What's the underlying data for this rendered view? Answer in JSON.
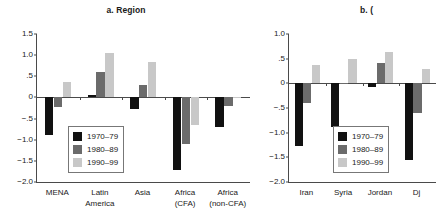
{
  "figure": {
    "background": "#ffffff",
    "series_colors": [
      "#111111",
      "#6b6b6b",
      "#c8c8c8"
    ]
  },
  "panels": [
    {
      "id": "a",
      "title": "a. Region",
      "legend": [
        "1970–79",
        "1980–89",
        "1990–99"
      ]
    },
    {
      "id": "b",
      "title": "b. (",
      "legend": [
        "1970–79",
        "1980–89",
        "1990–99"
      ]
    }
  ],
  "chart_data": [
    {
      "type": "bar",
      "title": "a. Region",
      "xlabel": "",
      "ylabel": "",
      "ylim": [
        -2.0,
        1.5
      ],
      "yticks": [
        1.5,
        1.0,
        0.5,
        0,
        -0.5,
        -1.0,
        -1.5,
        -2.0
      ],
      "ytick_labels": [
        "1.5",
        "1.0",
        ".5",
        "0",
        "−.5",
        "−1.0",
        "−1.5",
        "−2.0"
      ],
      "grid": false,
      "legend_position": "center-left-inside",
      "categories": [
        "MENA",
        "Latin America",
        "Asia",
        "Africa (CFA)",
        "Africa (non-CFA)"
      ],
      "category_lines": [
        [
          "MENA"
        ],
        [
          "Latin",
          "America"
        ],
        [
          "Asia"
        ],
        [
          "Africa",
          "(CFA)"
        ],
        [
          "Africa",
          "(non-CFA)"
        ]
      ],
      "series": [
        {
          "name": "1970–79",
          "color": "#111111",
          "values": [
            -0.88,
            0.05,
            -0.28,
            -1.72,
            -0.7
          ]
        },
        {
          "name": "1980–89",
          "color": "#6b6b6b",
          "values": [
            -0.22,
            0.59,
            0.3,
            -1.11,
            -0.2
          ]
        },
        {
          "name": "1990–99",
          "color": "#c8c8c8",
          "values": [
            0.37,
            1.04,
            0.83,
            -0.66,
            0.02
          ]
        }
      ]
    },
    {
      "type": "bar",
      "title": "b. (",
      "xlabel": "",
      "ylabel": "",
      "ylim": [
        -2.0,
        1.0
      ],
      "yticks": [
        1.0,
        0.5,
        0,
        -0.5,
        -1.0,
        -1.5,
        -2.0
      ],
      "ytick_labels": [
        "1.0",
        ".5",
        "0",
        "−.5",
        "−1.0",
        "−1.5",
        "−2.0"
      ],
      "grid": false,
      "legend_position": "center-right-inside",
      "categories": [
        "Iran",
        "Syria",
        "Jordan",
        "Dj"
      ],
      "category_lines": [
        [
          "Iran"
        ],
        [
          "Syria"
        ],
        [
          "Jordan"
        ],
        [
          "Dj"
        ]
      ],
      "series": [
        {
          "name": "1970–79",
          "color": "#111111",
          "values": [
            -1.28,
            -0.88,
            -0.07,
            -1.55
          ]
        },
        {
          "name": "1980–89",
          "color": "#6b6b6b",
          "values": [
            -0.4,
            -0.02,
            0.41,
            -0.6
          ]
        },
        {
          "name": "1990–99",
          "color": "#c8c8c8",
          "values": [
            0.37,
            0.5,
            0.64,
            0.3
          ]
        }
      ]
    }
  ]
}
